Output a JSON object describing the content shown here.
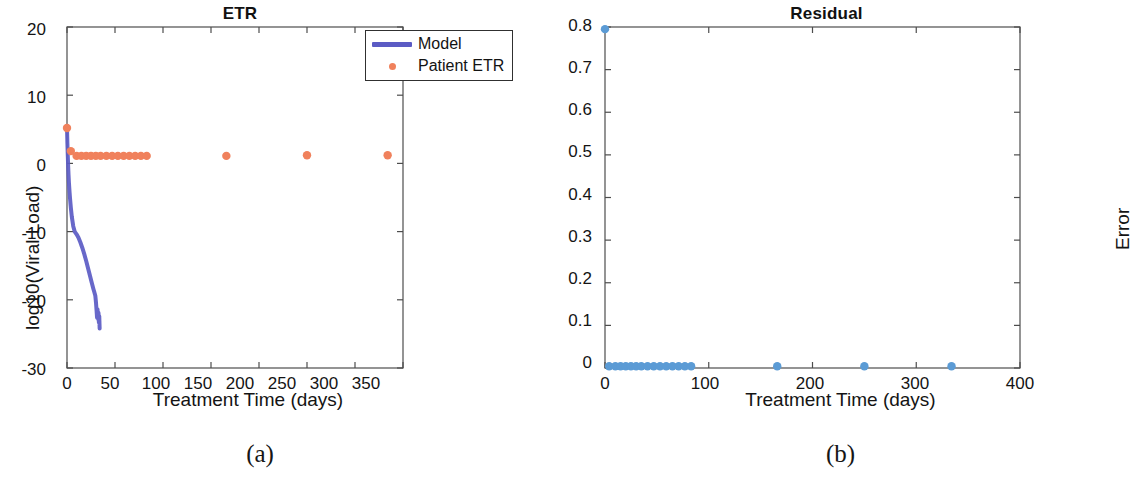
{
  "figure": {
    "panels": [
      {
        "caption": "(a)",
        "title": "ETR",
        "xlabel": "Treatment Time (days)",
        "ylabel": "log10(Viral Load)"
      },
      {
        "caption": "(b)",
        "title": "Residual",
        "xlabel": "Treatment Time (days)",
        "ylabel": "Error"
      }
    ]
  },
  "colors": {
    "model_line": "#5b5bc4",
    "patient_marker": "#f0815c",
    "residual_marker": "#5b9bd5",
    "axis": "#4d4d4d",
    "text": "#141414"
  },
  "chart_data": [
    {
      "type": "line",
      "title": "ETR",
      "xlabel": "Treatment Time (days)",
      "ylabel": "log10(Viral Load)",
      "xlim": [
        0,
        350
      ],
      "ylim": [
        -30,
        20
      ],
      "xticks": [
        0,
        50,
        100,
        150,
        200,
        250,
        300,
        350
      ],
      "xtick_labels": [
        "0",
        "50",
        "100",
        "150",
        "200",
        "250",
        "300",
        "350"
      ],
      "yticks": [
        -30,
        -20,
        -10,
        0,
        10,
        20
      ],
      "ytick_labels": [
        "-30",
        "-20",
        "-10",
        "0",
        "10",
        "20"
      ],
      "grid": false,
      "legend": {
        "position": "top-right",
        "entries": [
          {
            "label": "Model",
            "style": "line",
            "color": "#5b5bc4"
          },
          {
            "label": "Patient ETR",
            "style": "marker",
            "color": "#f0815c"
          }
        ]
      },
      "series": [
        {
          "name": "Model",
          "style": "line",
          "color": "#5b5bc4",
          "x": [
            0,
            0.4,
            0.8,
            1.2,
            1.6,
            2.0,
            2.6,
            3.2,
            4.0,
            5.0,
            6.5,
            8.0,
            10.0,
            12.0,
            14.0,
            16.0,
            18.0,
            20.0,
            22.0,
            24.0,
            26.0,
            27.5,
            28.5,
            29.5,
            30.2,
            30.8,
            31.3,
            31.8,
            32.3,
            32.8,
            33.2,
            33.6,
            34.0
          ],
          "y": [
            5.2,
            3.0,
            1.2,
            -0.4,
            -1.7,
            -2.8,
            -4.1,
            -5.2,
            -6.5,
            -7.8,
            -9.2,
            -10.0,
            -10.4,
            -10.9,
            -11.6,
            -12.4,
            -13.3,
            -14.3,
            -15.4,
            -16.5,
            -17.6,
            -18.4,
            -18.9,
            -19.4,
            -20.4,
            -21.6,
            -22.6,
            -21.4,
            -22.8,
            -21.9,
            -23.3,
            -22.4,
            -24.2
          ]
        },
        {
          "name": "Patient ETR",
          "style": "markers",
          "color": "#f0815c",
          "x": [
            0,
            4,
            10,
            15,
            20,
            25,
            30,
            35,
            41,
            47,
            53,
            59,
            65,
            71,
            77,
            83,
            166,
            250,
            334
          ],
          "y": [
            5.2,
            1.8,
            1.1,
            1.1,
            1.1,
            1.1,
            1.1,
            1.1,
            1.1,
            1.1,
            1.1,
            1.1,
            1.1,
            1.1,
            1.1,
            1.1,
            1.1,
            1.2,
            1.2
          ]
        }
      ]
    },
    {
      "type": "scatter",
      "title": "Residual",
      "xlabel": "Treatment Time (days)",
      "ylabel": "Error",
      "xlim": [
        0,
        400
      ],
      "ylim": [
        0,
        0.8
      ],
      "xticks": [
        0,
        100,
        200,
        300,
        400
      ],
      "xtick_labels": [
        "0",
        "100",
        "200",
        "300",
        "400"
      ],
      "yticks": [
        0,
        0.1,
        0.2,
        0.3,
        0.4,
        0.5,
        0.6,
        0.7,
        0.8
      ],
      "ytick_labels": [
        "0",
        "0.1",
        "0.2",
        "0.3",
        "0.4",
        "0.5",
        "0.6",
        "0.7",
        "0.8"
      ],
      "grid": false,
      "legend": null,
      "series": [
        {
          "name": "Error",
          "style": "markers",
          "color": "#5b9bd5",
          "x": [
            0,
            4,
            10,
            15,
            20,
            25,
            30,
            35,
            41,
            47,
            53,
            59,
            65,
            71,
            77,
            83,
            166,
            250,
            334
          ],
          "y": [
            0.795,
            0.004,
            0.004,
            0.004,
            0.004,
            0.004,
            0.004,
            0.004,
            0.004,
            0.004,
            0.004,
            0.004,
            0.004,
            0.004,
            0.004,
            0.004,
            0.004,
            0.004,
            0.004
          ]
        }
      ]
    }
  ]
}
